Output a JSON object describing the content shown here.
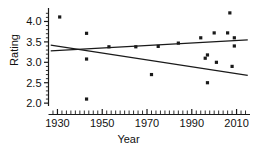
{
  "chart_data": {
    "type": "scatter",
    "title": "",
    "xlabel": "Year",
    "ylabel": "Rating",
    "xlim": [
      1926,
      2016
    ],
    "ylim": [
      1.93,
      4.33
    ],
    "grid": false,
    "legend": null,
    "xticks": [
      1930,
      1950,
      1970,
      1990,
      2010
    ],
    "xtick_labels": [
      "1930",
      "1950",
      "1970",
      "1990",
      "2010"
    ],
    "yticks": [
      2.0,
      2.5,
      3.0,
      3.5,
      4.0
    ],
    "ytick_labels": [
      "2.0",
      "2.5",
      "3.0",
      "3.5",
      "4.0"
    ],
    "x_minor_tick_step": 2,
    "y_minor_tick_step": 0.1,
    "points": [
      {
        "x": 1931,
        "y": 4.11
      },
      {
        "x": 1943,
        "y": 3.71
      },
      {
        "x": 1943,
        "y": 3.08
      },
      {
        "x": 1943,
        "y": 2.1
      },
      {
        "x": 1953,
        "y": 3.38
      },
      {
        "x": 1965,
        "y": 3.38
      },
      {
        "x": 1972,
        "y": 2.7
      },
      {
        "x": 1975,
        "y": 3.39
      },
      {
        "x": 1984,
        "y": 3.47
      },
      {
        "x": 1994,
        "y": 3.6
      },
      {
        "x": 1996,
        "y": 3.1
      },
      {
        "x": 1997,
        "y": 3.18
      },
      {
        "x": 1997,
        "y": 2.5
      },
      {
        "x": 2000,
        "y": 3.72
      },
      {
        "x": 2001,
        "y": 3.0
      },
      {
        "x": 2007,
        "y": 4.21
      },
      {
        "x": 2006,
        "y": 3.72
      },
      {
        "x": 2009,
        "y": 3.6
      },
      {
        "x": 2009,
        "y": 3.4
      },
      {
        "x": 2008,
        "y": 2.9
      }
    ],
    "series": [
      {
        "name": "rising-trend",
        "type": "line",
        "x": [
          1927,
          2015
        ],
        "values": [
          3.28,
          3.55
        ]
      },
      {
        "name": "falling-trend",
        "type": "line",
        "x": [
          1927,
          2015
        ],
        "values": [
          3.42,
          2.68
        ]
      }
    ],
    "marker_color": "#1a1a1a",
    "line_color": "#1a1a1a"
  }
}
